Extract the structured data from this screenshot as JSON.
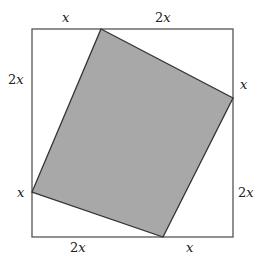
{
  "diagram": {
    "type": "geometry",
    "colors": {
      "outer_stroke": "#555555",
      "inner_fill": "#a8a8a8",
      "inner_stroke": "#333333",
      "label": "#222222"
    },
    "outer_square": {
      "x1": 32,
      "y1": 29,
      "x2": 233,
      "y2": 237
    },
    "inner_square": {
      "points": [
        [
          101,
          29
        ],
        [
          233,
          98
        ],
        [
          163,
          237
        ],
        [
          32,
          192
        ]
      ]
    },
    "labels": {
      "top_left": {
        "coef": "",
        "var": "x"
      },
      "top_right": {
        "coef": "2",
        "var": "x"
      },
      "right_top": {
        "coef": "",
        "var": "x"
      },
      "right_bottom": {
        "coef": "2",
        "var": "x"
      },
      "bottom_right": {
        "coef": "",
        "var": "x"
      },
      "bottom_left": {
        "coef": "2",
        "var": "x"
      },
      "left_bottom": {
        "coef": "",
        "var": "x"
      },
      "left_top": {
        "coef": "2",
        "var": "x"
      }
    }
  }
}
